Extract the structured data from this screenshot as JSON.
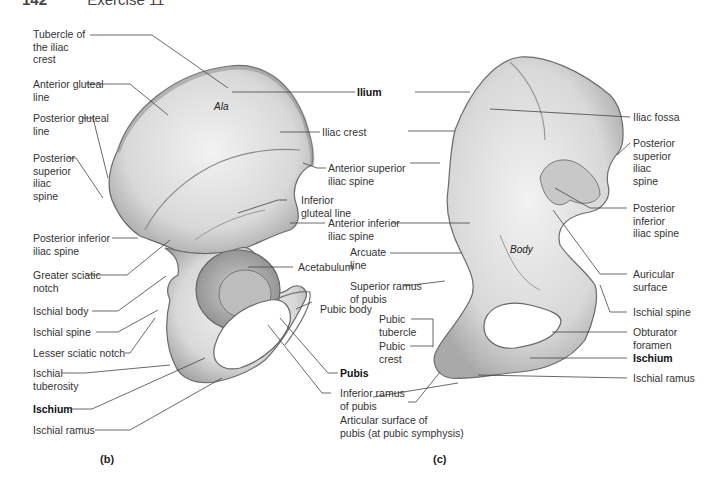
{
  "header": {
    "page_number": "142",
    "section": "Exercise 11"
  },
  "figure_b": {
    "caption": "(b)",
    "bone_region_labels": {
      "ala": "Ala"
    },
    "labels": [
      {
        "id": "tubercle-iliac-crest",
        "lines": [
          "Tubercle of",
          "the iliac",
          "crest"
        ]
      },
      {
        "id": "anterior-gluteal-line",
        "lines": [
          "Anterior gluteal",
          "line"
        ]
      },
      {
        "id": "posterior-gluteal-line",
        "lines": [
          "Posterior gluteal",
          "line"
        ]
      },
      {
        "id": "posterior-superior-iliac-spine",
        "lines": [
          "Posterior",
          "superior",
          "iliac",
          "spine"
        ]
      },
      {
        "id": "posterior-inferior-iliac-spine",
        "lines": [
          "Posterior inferior",
          "iliac spine"
        ]
      },
      {
        "id": "greater-sciatic-notch",
        "lines": [
          "Greater sciatic",
          "notch"
        ]
      },
      {
        "id": "ischial-body",
        "lines": [
          "Ischial body"
        ]
      },
      {
        "id": "ischial-spine",
        "lines": [
          "Ischial spine"
        ]
      },
      {
        "id": "lesser-sciatic-notch",
        "lines": [
          "Lesser sciatic notch"
        ]
      },
      {
        "id": "ischial-tuberosity",
        "lines": [
          "Ischial",
          "tuberosity"
        ]
      },
      {
        "id": "ischium",
        "lines": [
          "Ischium"
        ],
        "bold": true
      },
      {
        "id": "ischial-ramus",
        "lines": [
          "Ischial ramus"
        ]
      }
    ],
    "center_labels": [
      {
        "id": "ilium",
        "lines": [
          "Ilium"
        ],
        "bold": true
      },
      {
        "id": "iliac-crest",
        "lines": [
          "Iliac crest"
        ]
      },
      {
        "id": "anterior-superior-iliac-spine",
        "lines": [
          "Anterior superior",
          "iliac spine"
        ]
      },
      {
        "id": "inferior-gluteal-line",
        "lines": [
          "Inferior",
          "gluteal line"
        ]
      },
      {
        "id": "anterior-inferior-iliac-spine",
        "lines": [
          "Anterior inferior",
          "iliac spine"
        ]
      },
      {
        "id": "acetabulum",
        "lines": [
          "Acetabulum"
        ]
      },
      {
        "id": "pubic-body",
        "lines": [
          "Pubic body"
        ]
      },
      {
        "id": "pubis",
        "lines": [
          "Pubis"
        ],
        "bold": true
      },
      {
        "id": "inferior-ramus-of-pubis",
        "lines": [
          "Inferior ramus",
          "of pubis"
        ]
      },
      {
        "id": "articular-surface-of-pubis",
        "lines": [
          "Articular surface of",
          "pubis (at pubic symphysis)"
        ]
      }
    ]
  },
  "figure_c": {
    "caption": "(c)",
    "bone_region_labels": {
      "body": "Body"
    },
    "left_labels": [
      {
        "id": "arcuate-line",
        "lines": [
          "Arcuate",
          "line"
        ]
      },
      {
        "id": "superior-ramus-of-pubis",
        "lines": [
          "Superior ramus",
          "of pubis"
        ]
      },
      {
        "id": "pubic-tubercle",
        "lines": [
          "Pubic",
          "tubercle"
        ]
      },
      {
        "id": "pubic-crest",
        "lines": [
          "Pubic",
          "crest"
        ]
      }
    ],
    "right_labels": [
      {
        "id": "iliac-fossa",
        "lines": [
          "Iliac fossa"
        ]
      },
      {
        "id": "posterior-superior-iliac-spine",
        "lines": [
          "Posterior",
          "superior",
          "iliac",
          "spine"
        ]
      },
      {
        "id": "posterior-inferior-iliac-spine",
        "lines": [
          "Posterior",
          "inferior",
          "iliac spine"
        ]
      },
      {
        "id": "auricular-surface",
        "lines": [
          "Auricular",
          "surface"
        ]
      },
      {
        "id": "ischial-spine",
        "lines": [
          "Ischial spine"
        ]
      },
      {
        "id": "obturator-foramen",
        "lines": [
          "Obturator",
          "foramen"
        ]
      },
      {
        "id": "ischium",
        "lines": [
          "Ischium"
        ],
        "bold": true
      },
      {
        "id": "ischial-ramus",
        "lines": [
          "Ischial ramus"
        ]
      }
    ]
  }
}
